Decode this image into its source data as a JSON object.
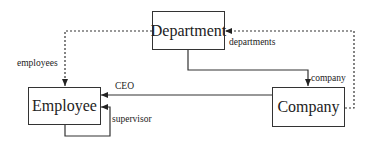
{
  "diagram": {
    "entities": [
      {
        "id": "department",
        "label": "Department"
      },
      {
        "id": "employee",
        "label": "Employee"
      },
      {
        "id": "company",
        "label": "Company"
      }
    ],
    "relations": [
      {
        "id": "employees",
        "label": "employees",
        "from": "Department",
        "to": "Employee",
        "style": "dotted"
      },
      {
        "id": "departments",
        "label": "departments",
        "from": "Company",
        "to": "Department",
        "style": "dotted"
      },
      {
        "id": "company",
        "label": "company",
        "from": "Department",
        "to": "Company",
        "style": "solid"
      },
      {
        "id": "ceo",
        "label": "CEO",
        "from": "Company",
        "to": "Employee",
        "style": "solid"
      },
      {
        "id": "supervisor",
        "label": "supervisor",
        "from": "Employee",
        "to": "Employee",
        "style": "solid"
      }
    ],
    "colors": {
      "line": "#333333",
      "text": "#222222",
      "background": "#ffffff"
    }
  }
}
